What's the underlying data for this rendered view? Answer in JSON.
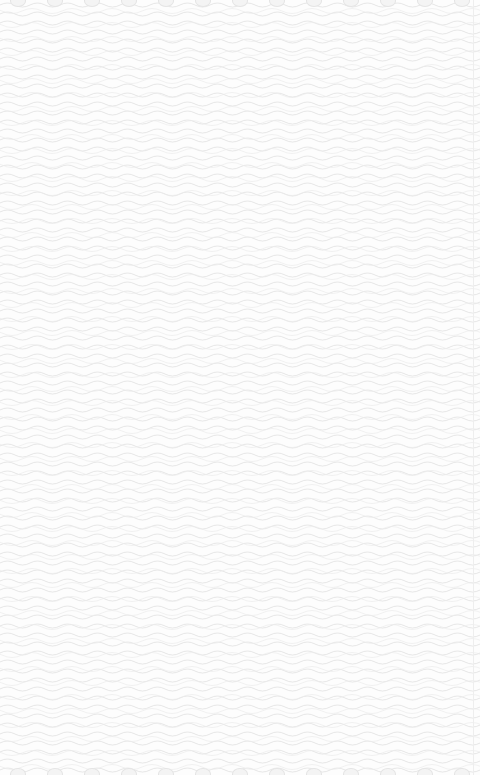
{
  "page": {
    "background_color": "#fdfdfd",
    "pattern": "wavy-lines",
    "pattern_color": "#e2e2e2"
  },
  "top_edge_shapes": 13,
  "bottom_edge_shapes": 13
}
